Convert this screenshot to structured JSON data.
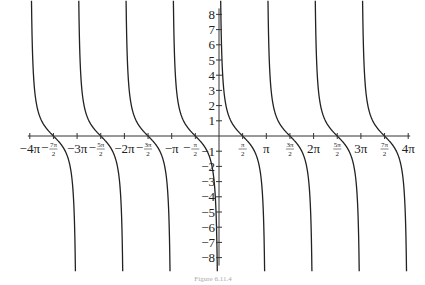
{
  "chart_data": {
    "type": "line",
    "title": "",
    "function": "cot(x)",
    "xlabel": "",
    "ylabel": "",
    "xlim_multiple_of_pi": [
      -4,
      4
    ],
    "ylim": [
      -8,
      8
    ],
    "grid": false,
    "asymptotes_multiple_of_pi": [
      -4,
      -3,
      -2,
      -1,
      0,
      1,
      2,
      3,
      4
    ],
    "zeros_multiple_of_pi": [
      -3.5,
      -2.5,
      -1.5,
      -0.5,
      0.5,
      1.5,
      2.5,
      3.5
    ],
    "x_ticks": [
      {
        "value": -4,
        "label": "−4π",
        "kind": "text"
      },
      {
        "value": -3.5,
        "label": "−",
        "num": "7π",
        "den": "2",
        "kind": "frac"
      },
      {
        "value": -3,
        "label": "−3π",
        "kind": "text"
      },
      {
        "value": -2.5,
        "label": "−",
        "num": "5π",
        "den": "2",
        "kind": "frac"
      },
      {
        "value": -2,
        "label": "−2π",
        "kind": "text"
      },
      {
        "value": -1.5,
        "label": "−",
        "num": "3π",
        "den": "2",
        "kind": "frac"
      },
      {
        "value": -1,
        "label": "−π",
        "kind": "text"
      },
      {
        "value": -0.5,
        "label": "−",
        "num": "π",
        "den": "2",
        "kind": "frac"
      },
      {
        "value": 0.5,
        "label": "",
        "num": "π",
        "den": "2",
        "kind": "frac"
      },
      {
        "value": 1,
        "label": "π",
        "kind": "text"
      },
      {
        "value": 1.5,
        "label": "",
        "num": "3π",
        "den": "2",
        "kind": "frac"
      },
      {
        "value": 2,
        "label": "2π",
        "kind": "text"
      },
      {
        "value": 2.5,
        "label": "",
        "num": "5π",
        "den": "2",
        "kind": "frac"
      },
      {
        "value": 3,
        "label": "3π",
        "kind": "text"
      },
      {
        "value": 3.5,
        "label": "",
        "num": "7π",
        "den": "2",
        "kind": "frac"
      },
      {
        "value": 4,
        "label": "4π",
        "kind": "text"
      }
    ],
    "y_ticks": [
      {
        "value": 8,
        "label": "8"
      },
      {
        "value": 7,
        "label": "7"
      },
      {
        "value": 6,
        "label": "6"
      },
      {
        "value": 5,
        "label": "5"
      },
      {
        "value": 4,
        "label": "4"
      },
      {
        "value": 3,
        "label": "3"
      },
      {
        "value": 2,
        "label": "2"
      },
      {
        "value": 1,
        "label": "1"
      },
      {
        "value": -1,
        "label": "−1"
      },
      {
        "value": -2,
        "label": "−2"
      },
      {
        "value": -3,
        "label": "−3"
      },
      {
        "value": -4,
        "label": "−4"
      },
      {
        "value": -5,
        "label": "−5"
      },
      {
        "value": -6,
        "label": "−6"
      },
      {
        "value": -7,
        "label": "−7"
      },
      {
        "value": -8,
        "label": "−8"
      }
    ],
    "caption": "Figure 6.11.4"
  }
}
